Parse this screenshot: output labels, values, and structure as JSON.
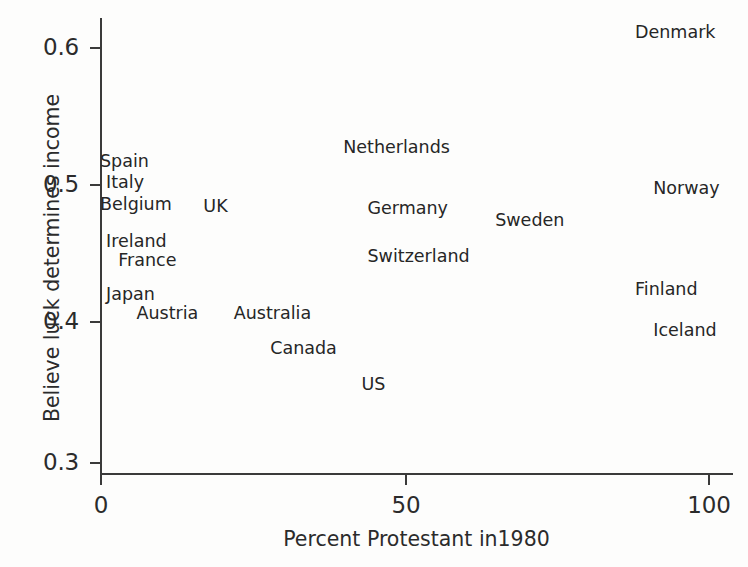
{
  "chart_data": {
    "type": "scatter",
    "title": "",
    "xlabel": "Percent Protestant in1980",
    "ylabel": "Believe luck determines income",
    "xlim": [
      -2,
      104
    ],
    "ylim": [
      0.29,
      0.625
    ],
    "xticks": [
      "0",
      "50",
      "100"
    ],
    "xtick_values": [
      0,
      50,
      100
    ],
    "yticks": [
      "0.3",
      "0.4",
      "0.5",
      "0.6"
    ],
    "ytick_values": [
      0.3,
      0.4,
      0.5,
      0.6
    ],
    "grid": false,
    "legend": "none",
    "marker_style": "text-label-only",
    "points": [
      {
        "label": "Spain",
        "x": 0,
        "y": 0.517
      },
      {
        "label": "Italy",
        "x": 1,
        "y": 0.502
      },
      {
        "label": "Belgium",
        "x": 0,
        "y": 0.486
      },
      {
        "label": "Ireland",
        "x": 1,
        "y": 0.459
      },
      {
        "label": "France",
        "x": 3,
        "y": 0.445
      },
      {
        "label": "Japan",
        "x": 1,
        "y": 0.421
      },
      {
        "label": "Austria",
        "x": 6,
        "y": 0.407
      },
      {
        "label": "UK",
        "x": 17,
        "y": 0.484
      },
      {
        "label": "Australia",
        "x": 22,
        "y": 0.407
      },
      {
        "label": "Canada",
        "x": 28,
        "y": 0.382
      },
      {
        "label": "Netherlands",
        "x": 40,
        "y": 0.527
      },
      {
        "label": "Germany",
        "x": 44,
        "y": 0.483
      },
      {
        "label": "Switzerland",
        "x": 44,
        "y": 0.448
      },
      {
        "label": "US",
        "x": 43,
        "y": 0.356
      },
      {
        "label": "Sweden",
        "x": 65,
        "y": 0.474
      },
      {
        "label": "Denmark",
        "x": 88,
        "y": 0.61
      },
      {
        "label": "Norway",
        "x": 91,
        "y": 0.497
      },
      {
        "label": "Finland",
        "x": 88,
        "y": 0.424
      },
      {
        "label": "Iceland",
        "x": 91,
        "y": 0.395
      }
    ]
  },
  "axes": {
    "y_title": "Believe luck determines income",
    "x_title": "Percent Protestant in1980",
    "y_ticklabels": [
      "0.6",
      "0.5",
      "0.4",
      "0.3"
    ],
    "x_ticklabels": [
      "0",
      "50",
      "100"
    ]
  },
  "colors": {
    "axis": "#3a3a3a",
    "text": "#262626",
    "background": "#fdfdfc"
  }
}
